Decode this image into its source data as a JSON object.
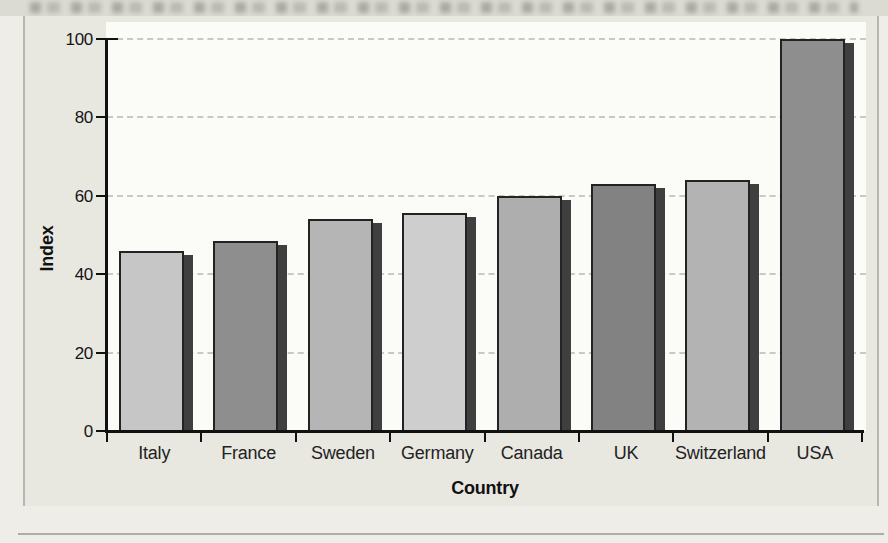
{
  "chart_data": {
    "type": "bar",
    "title": "",
    "xlabel": "Country",
    "ylabel": "Index",
    "categories": [
      "Italy",
      "France",
      "Sweden",
      "Germany",
      "Canada",
      "UK",
      "Switzerland",
      "USA"
    ],
    "values": [
      46,
      48.5,
      54,
      55.5,
      60,
      63,
      64,
      100
    ],
    "ylim": [
      0,
      100
    ],
    "yticks": [
      0,
      20,
      40,
      60,
      80,
      100
    ],
    "grid": "horizontal-dashed",
    "legend": "none",
    "bar_colors": [
      "#c6c6c6",
      "#8e8e8e",
      "#b5b5b5",
      "#cecece",
      "#aeaeae",
      "#828282",
      "#b3b3b3",
      "#8e8e8e"
    ],
    "colors": {
      "bar_shadow": "#3f3f3f",
      "bar_outline": "#232323",
      "axis": "#111111",
      "gridline": "#c9c8c1",
      "plot_background": "#fbfbf8",
      "panel_background": "#e8e7e0",
      "page_background": "#efede7"
    }
  }
}
